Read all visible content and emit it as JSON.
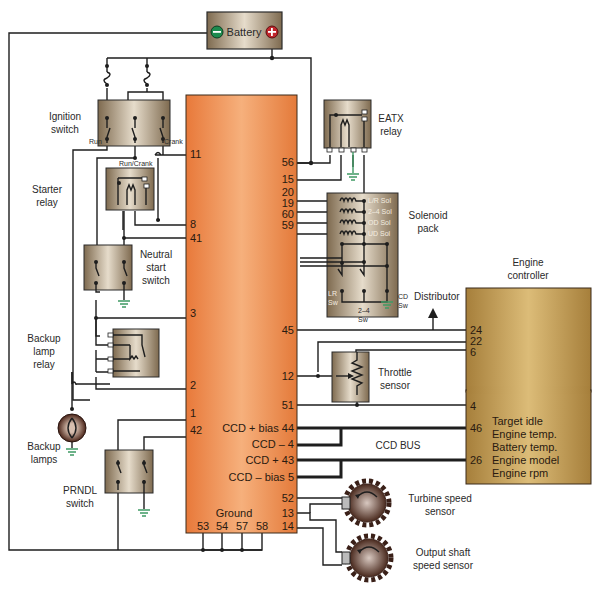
{
  "diagram": {
    "colors": {
      "controller_fill": "#f0924e",
      "component_fill": "#b49e80",
      "engine_controller_fill": "#c9a35a",
      "battery_negative": "#1c8a4e",
      "battery_positive": "#c0262b",
      "ground_symbol": "#3f9b64",
      "wire": "#1e1e1e"
    },
    "components": {
      "battery": {
        "label": "Battery",
        "negative": "−",
        "positive": "+"
      },
      "ignition_switch": {
        "label_line1": "Ignition",
        "label_line2": "switch",
        "terminal_run": "Run",
        "terminal_crank": "Crank",
        "terminal_run_crank": "Run/Crank"
      },
      "starter_relay": {
        "label_line1": "Starter",
        "label_line2": "relay"
      },
      "neutral_start_switch": {
        "label_line1": "Neutral",
        "label_line2": "start",
        "label_line3": "switch"
      },
      "backup_lamp_relay": {
        "label_line1": "Backup",
        "label_line2": "lamp",
        "label_line3": "relay"
      },
      "backup_lamps": {
        "label_line1": "Backup",
        "label_line2": "lamps"
      },
      "prndl_switch": {
        "label_line1": "PRNDL",
        "label_line2": "switch"
      },
      "eatx_relay": {
        "label_line1": "EATX",
        "label_line2": "relay"
      },
      "solenoid_pack": {
        "label_line1": "Solenoid",
        "label_line2": "pack",
        "solenoids": [
          "L/R Sol",
          "2–4 Sol",
          "OD Sol",
          "UD Sol"
        ],
        "switches": {
          "lr_line1": "LR",
          "lr_line2": "Sw",
          "s24_line1": "2–4",
          "s24_line2": "Sw",
          "cd_line1": "CD",
          "cd_line2": "Sw"
        }
      },
      "distributor": {
        "label": "Distributor"
      },
      "throttle_sensor": {
        "label_line1": "Throttle",
        "label_line2": "sensor"
      },
      "engine_controller": {
        "label_line1": "Engine",
        "label_line2": "controller",
        "pins": [
          "24",
          "22",
          "6",
          "4",
          "46",
          "26"
        ],
        "messages": [
          "Target idle",
          "Engine temp.",
          "Battery temp.",
          "Engine model",
          "Engine rpm"
        ]
      },
      "ccd_bus": {
        "label": "CCD BUS"
      },
      "turbine_speed_sensor": {
        "label_line1": "Turbine speed",
        "label_line2": "sensor"
      },
      "output_shaft_speed_sensor": {
        "label_line1": "Output shaft",
        "label_line2": "speed sensor"
      }
    },
    "transmission_controller": {
      "left_pins": [
        "11",
        "8",
        "41",
        "3",
        "2",
        "1",
        "42"
      ],
      "right_pins": [
        "56",
        "15",
        "20",
        "19",
        "60",
        "59",
        "45",
        "12",
        "51"
      ],
      "ccd_pins": [
        "CCD + bias 44",
        "CCD – 4",
        "CCD + 43",
        "CCD – bias 5"
      ],
      "lower_right_pins": [
        "52",
        "13",
        "14"
      ],
      "ground_label": "Ground",
      "ground_pins": [
        "53",
        "54",
        "57",
        "58"
      ]
    }
  }
}
